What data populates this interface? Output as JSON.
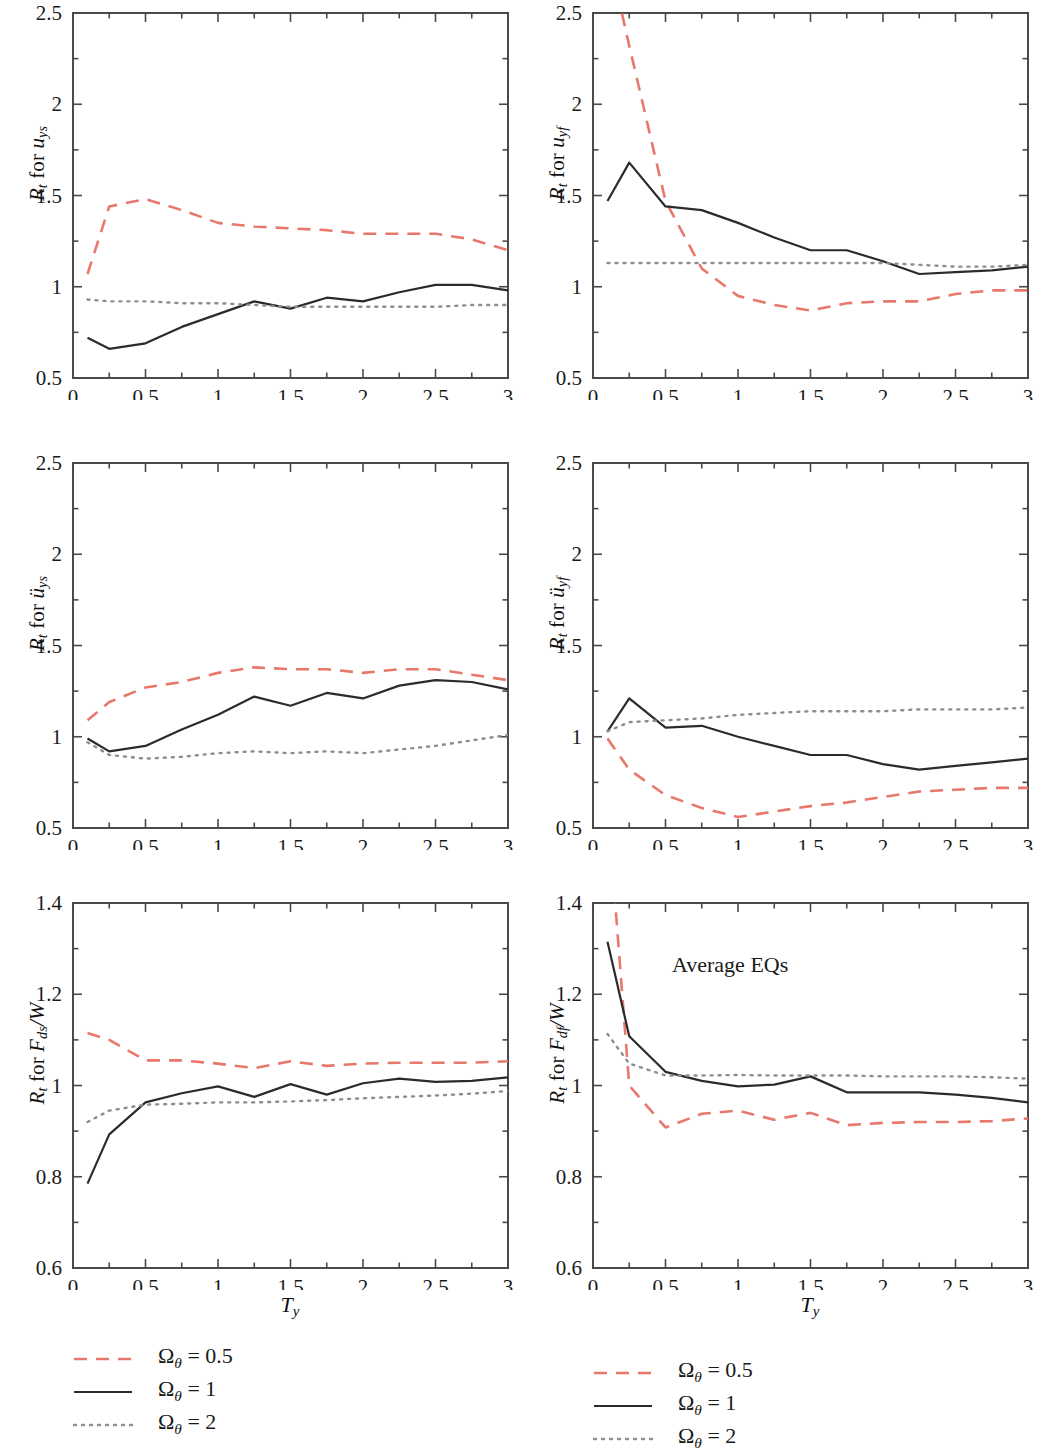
{
  "figure": {
    "annotation": "Average EQs",
    "xlabel_left": "T",
    "xlabel_left_sub": "y",
    "xlabel_right": "T",
    "xlabel_right_sub": "y",
    "colors": {
      "series_0p5": "#e8776c",
      "series_1": "#2b2b2b",
      "series_2": "#8d8d8d",
      "axis": "#4a4a4a",
      "text": "#1a1a1a",
      "background": "#ffffff"
    }
  },
  "legends": [
    {
      "name": "legend-left",
      "items": [
        {
          "label_prefix": "Ω",
          "label_sub": "θ",
          "label_suffix": " = 0.5",
          "style": "dashed",
          "color": "#e8776c"
        },
        {
          "label_prefix": "Ω",
          "label_sub": "θ",
          "label_suffix": " = 1",
          "style": "solid",
          "color": "#2b2b2b"
        },
        {
          "label_prefix": "Ω",
          "label_sub": "θ",
          "label_suffix": " = 2",
          "style": "dotted",
          "color": "#8d8d8d"
        }
      ]
    },
    {
      "name": "legend-right",
      "items": [
        {
          "label_prefix": "Ω",
          "label_sub": "θ",
          "label_suffix": " = 0.5",
          "style": "dashed",
          "color": "#e8776c"
        },
        {
          "label_prefix": "Ω",
          "label_sub": "θ",
          "label_suffix": " = 1",
          "style": "solid",
          "color": "#2b2b2b"
        },
        {
          "label_prefix": "Ω",
          "label_sub": "θ",
          "label_suffix": " = 2",
          "style": "dotted",
          "color": "#8d8d8d"
        }
      ]
    }
  ],
  "chart_data": [
    {
      "name": "panel-uys",
      "type": "line",
      "title": "",
      "xlabel": "T_y",
      "ylabel": "R_t for u_ys",
      "ylabel_parts": {
        "main": "R",
        "main_sub": "t",
        "mid": " for ",
        "var": "u",
        "var_sub": "ys",
        "accent": ""
      },
      "xlim": [
        0,
        3
      ],
      "ylim": [
        0.5,
        2.5
      ],
      "xticks": [
        0,
        0.5,
        1,
        1.5,
        2,
        2.5,
        3
      ],
      "xticklabels": [
        "0",
        "0.5",
        "1",
        "1.5",
        "2",
        "2.5",
        "3"
      ],
      "yticks": [
        0.5,
        1,
        1.5,
        2,
        2.5
      ],
      "yticklabels": [
        "0.5",
        "1",
        "1.5",
        "2",
        "2.5"
      ],
      "minor_xtick_step": 0.25,
      "minor_ytick_step": 0.25,
      "grid": false,
      "x": [
        0.1,
        0.25,
        0.5,
        0.75,
        1.0,
        1.25,
        1.5,
        1.75,
        2.0,
        2.25,
        2.5,
        2.75,
        3.0
      ],
      "series": [
        {
          "name": "Ωθ = 0.5",
          "style": "dashed",
          "color": "#e8776c",
          "values": [
            1.07,
            1.44,
            1.48,
            1.42,
            1.35,
            1.33,
            1.32,
            1.31,
            1.29,
            1.29,
            1.29,
            1.26,
            1.2
          ]
        },
        {
          "name": "Ωθ = 1",
          "style": "solid",
          "color": "#2b2b2b",
          "values": [
            0.72,
            0.66,
            0.69,
            0.78,
            0.85,
            0.92,
            0.88,
            0.94,
            0.92,
            0.97,
            1.01,
            1.01,
            0.98
          ]
        },
        {
          "name": "Ωθ = 2",
          "style": "dotted",
          "color": "#8d8d8d",
          "values": [
            0.93,
            0.92,
            0.92,
            0.91,
            0.91,
            0.9,
            0.89,
            0.89,
            0.89,
            0.89,
            0.89,
            0.9,
            0.9
          ]
        }
      ]
    },
    {
      "name": "panel-uyf",
      "type": "line",
      "title": "",
      "xlabel": "T_y",
      "ylabel": "R_t for u_yf",
      "ylabel_parts": {
        "main": "R",
        "main_sub": "t",
        "mid": " for ",
        "var": "u",
        "var_sub": "yf",
        "accent": ""
      },
      "xlim": [
        0,
        3
      ],
      "ylim": [
        0.5,
        2.5
      ],
      "xticks": [
        0,
        0.5,
        1,
        1.5,
        2,
        2.5,
        3
      ],
      "xticklabels": [
        "0",
        "0.5",
        "1",
        "1.5",
        "2",
        "2.5",
        "3"
      ],
      "yticks": [
        0.5,
        1,
        1.5,
        2,
        2.5
      ],
      "yticklabels": [
        "0.5",
        "1",
        "1.5",
        "2",
        "2.5"
      ],
      "minor_xtick_step": 0.25,
      "minor_ytick_step": 0.25,
      "grid": false,
      "x": [
        0.1,
        0.25,
        0.5,
        0.75,
        1.0,
        1.25,
        1.5,
        1.75,
        2.0,
        2.25,
        2.5,
        2.75,
        3.0
      ],
      "series": [
        {
          "name": "Ωθ = 0.5",
          "style": "dashed",
          "color": "#e8776c",
          "values": [
            2.85,
            2.32,
            1.47,
            1.1,
            0.95,
            0.9,
            0.87,
            0.91,
            0.92,
            0.92,
            0.96,
            0.98,
            0.98
          ]
        },
        {
          "name": "Ωθ = 1",
          "style": "solid",
          "color": "#2b2b2b",
          "values": [
            1.47,
            1.68,
            1.44,
            1.42,
            1.35,
            1.27,
            1.2,
            1.2,
            1.14,
            1.07,
            1.08,
            1.09,
            1.11
          ]
        },
        {
          "name": "Ωθ = 2",
          "style": "dotted",
          "color": "#8d8d8d",
          "values": [
            1.13,
            1.13,
            1.13,
            1.13,
            1.13,
            1.13,
            1.13,
            1.13,
            1.13,
            1.12,
            1.11,
            1.11,
            1.12
          ]
        }
      ]
    },
    {
      "name": "panel-uys-acc",
      "type": "line",
      "title": "",
      "xlabel": "T_y",
      "ylabel": "R_t for ü_ys",
      "ylabel_parts": {
        "main": "R",
        "main_sub": "t",
        "mid": " for ",
        "var": "ü",
        "var_sub": "ys",
        "accent": "double-dot"
      },
      "xlim": [
        0,
        3
      ],
      "ylim": [
        0.5,
        2.5
      ],
      "xticks": [
        0,
        0.5,
        1,
        1.5,
        2,
        2.5,
        3
      ],
      "xticklabels": [
        "0",
        "0.5",
        "1",
        "1.5",
        "2",
        "2.5",
        "3"
      ],
      "yticks": [
        0.5,
        1,
        1.5,
        2,
        2.5
      ],
      "yticklabels": [
        "0.5",
        "1",
        "1.5",
        "2",
        "2.5"
      ],
      "minor_xtick_step": 0.25,
      "minor_ytick_step": 0.25,
      "grid": false,
      "x": [
        0.1,
        0.25,
        0.5,
        0.75,
        1.0,
        1.25,
        1.5,
        1.75,
        2.0,
        2.25,
        2.5,
        2.75,
        3.0
      ],
      "series": [
        {
          "name": "Ωθ = 0.5",
          "style": "dashed",
          "color": "#e8776c",
          "values": [
            1.09,
            1.19,
            1.27,
            1.3,
            1.35,
            1.38,
            1.37,
            1.37,
            1.35,
            1.37,
            1.37,
            1.34,
            1.31
          ]
        },
        {
          "name": "Ωθ = 1",
          "style": "solid",
          "color": "#2b2b2b",
          "values": [
            0.99,
            0.92,
            0.95,
            1.04,
            1.12,
            1.22,
            1.17,
            1.24,
            1.21,
            1.28,
            1.31,
            1.3,
            1.26
          ]
        },
        {
          "name": "Ωθ = 2",
          "style": "dotted",
          "color": "#8d8d8d",
          "values": [
            0.97,
            0.9,
            0.88,
            0.89,
            0.91,
            0.92,
            0.91,
            0.92,
            0.91,
            0.93,
            0.95,
            0.98,
            1.01
          ]
        }
      ]
    },
    {
      "name": "panel-uyf-acc",
      "type": "line",
      "title": "",
      "xlabel": "T_y",
      "ylabel": "R_t for ü_yf",
      "ylabel_parts": {
        "main": "R",
        "main_sub": "t",
        "mid": " for ",
        "var": "ü",
        "var_sub": "yf",
        "accent": "double-dot"
      },
      "xlim": [
        0,
        3
      ],
      "ylim": [
        0.5,
        2.5
      ],
      "xticks": [
        0,
        0.5,
        1,
        1.5,
        2,
        2.5,
        3
      ],
      "xticklabels": [
        "0",
        "0.5",
        "1",
        "1.5",
        "2",
        "2.5",
        "3"
      ],
      "yticks": [
        0.5,
        1,
        1.5,
        2,
        2.5
      ],
      "yticklabels": [
        "0.5",
        "1",
        "1.5",
        "2",
        "2.5"
      ],
      "minor_xtick_step": 0.25,
      "minor_ytick_step": 0.25,
      "grid": false,
      "x": [
        0.1,
        0.25,
        0.5,
        0.75,
        1.0,
        1.25,
        1.5,
        1.75,
        2.0,
        2.25,
        2.5,
        2.75,
        3.0
      ],
      "series": [
        {
          "name": "Ωθ = 0.5",
          "style": "dashed",
          "color": "#e8776c",
          "values": [
            0.99,
            0.82,
            0.68,
            0.61,
            0.56,
            0.59,
            0.62,
            0.64,
            0.67,
            0.7,
            0.71,
            0.72,
            0.72
          ]
        },
        {
          "name": "Ωθ = 1",
          "style": "solid",
          "color": "#2b2b2b",
          "values": [
            1.03,
            1.21,
            1.05,
            1.06,
            1.0,
            0.95,
            0.9,
            0.9,
            0.85,
            0.82,
            0.84,
            0.86,
            0.88
          ]
        },
        {
          "name": "Ωθ = 2",
          "style": "dotted",
          "color": "#8d8d8d",
          "values": [
            1.03,
            1.08,
            1.09,
            1.1,
            1.12,
            1.13,
            1.14,
            1.14,
            1.14,
            1.15,
            1.15,
            1.15,
            1.16
          ]
        }
      ]
    },
    {
      "name": "panel-fds",
      "type": "line",
      "title": "",
      "xlabel": "T_y",
      "ylabel": "R_t for F_ds/W",
      "ylabel_parts": {
        "main": "R",
        "main_sub": "t",
        "mid": " for ",
        "var": "F",
        "var_sub": "ds",
        "suffix": "/W",
        "accent": ""
      },
      "xlim": [
        0,
        3
      ],
      "ylim": [
        0.6,
        1.4
      ],
      "xticks": [
        0,
        0.5,
        1,
        1.5,
        2,
        2.5,
        3
      ],
      "xticklabels": [
        "0",
        "0.5",
        "1",
        "1.5",
        "2",
        "2.5",
        "3"
      ],
      "yticks": [
        0.6,
        0.8,
        1.0,
        1.2,
        1.4
      ],
      "yticklabels": [
        "0.6",
        "0.8",
        "1",
        "1.2",
        "1.4"
      ],
      "minor_xtick_step": 0.25,
      "minor_ytick_step": 0.1,
      "grid": false,
      "x": [
        0.1,
        0.25,
        0.5,
        0.75,
        1.0,
        1.25,
        1.5,
        1.75,
        2.0,
        2.25,
        2.5,
        2.75,
        3.0
      ],
      "series": [
        {
          "name": "Ωθ = 0.5",
          "style": "dashed",
          "color": "#e8776c",
          "values": [
            1.115,
            1.1,
            1.055,
            1.055,
            1.048,
            1.038,
            1.053,
            1.043,
            1.048,
            1.05,
            1.05,
            1.05,
            1.053
          ]
        },
        {
          "name": "Ωθ = 1",
          "style": "solid",
          "color": "#2b2b2b",
          "values": [
            0.785,
            0.893,
            0.963,
            0.983,
            0.998,
            0.975,
            1.003,
            0.98,
            1.005,
            1.015,
            1.008,
            1.01,
            1.018
          ]
        },
        {
          "name": "Ωθ = 2",
          "style": "dotted",
          "color": "#8d8d8d",
          "values": [
            0.92,
            0.945,
            0.958,
            0.96,
            0.963,
            0.963,
            0.965,
            0.968,
            0.972,
            0.975,
            0.978,
            0.982,
            0.988
          ]
        }
      ]
    },
    {
      "name": "panel-fdf",
      "type": "line",
      "title": "",
      "xlabel": "T_y",
      "ylabel": "R_t for F_df/W",
      "ylabel_parts": {
        "main": "R",
        "main_sub": "t",
        "mid": " for ",
        "var": "F",
        "var_sub": "df",
        "suffix": "/W",
        "accent": ""
      },
      "xlim": [
        0,
        3
      ],
      "ylim": [
        0.6,
        1.4
      ],
      "xticks": [
        0,
        0.5,
        1,
        1.5,
        2,
        2.5,
        3
      ],
      "xticklabels": [
        "0",
        "0.5",
        "1",
        "1.5",
        "2",
        "2.5",
        "3"
      ],
      "yticks": [
        0.6,
        0.8,
        1.0,
        1.2,
        1.4
      ],
      "yticklabels": [
        "0.6",
        "0.8",
        "1",
        "1.2",
        "1.4"
      ],
      "minor_xtick_step": 0.25,
      "minor_ytick_step": 0.1,
      "grid": false,
      "x": [
        0.1,
        0.25,
        0.5,
        0.75,
        1.0,
        1.25,
        1.5,
        1.75,
        2.0,
        2.25,
        2.5,
        2.75,
        3.0
      ],
      "series": [
        {
          "name": "Ωθ = 0.5",
          "style": "dashed",
          "color": "#e8776c",
          "values": [
            1.62,
            1.0,
            0.908,
            0.938,
            0.945,
            0.925,
            0.94,
            0.913,
            0.918,
            0.92,
            0.92,
            0.922,
            0.928
          ]
        },
        {
          "name": "Ωθ = 1",
          "style": "solid",
          "color": "#2b2b2b",
          "values": [
            1.315,
            1.108,
            1.03,
            1.01,
            0.998,
            1.002,
            1.02,
            0.985,
            0.985,
            0.985,
            0.98,
            0.973,
            0.963
          ]
        },
        {
          "name": "Ωθ = 2",
          "style": "dotted",
          "color": "#8d8d8d",
          "values": [
            1.113,
            1.048,
            1.022,
            1.022,
            1.023,
            1.022,
            1.022,
            1.022,
            1.02,
            1.02,
            1.02,
            1.018,
            1.015
          ]
        }
      ]
    }
  ]
}
